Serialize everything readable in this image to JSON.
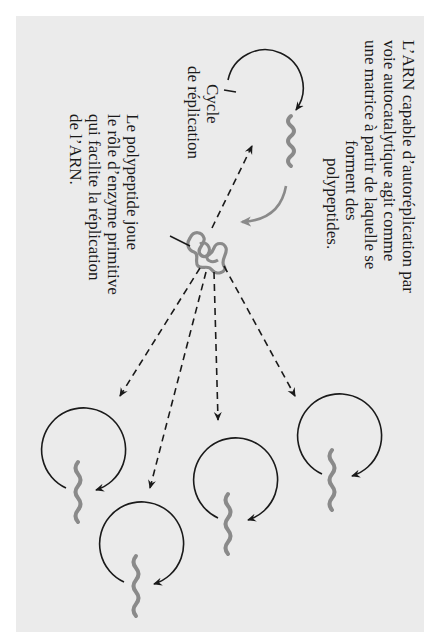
{
  "figure": {
    "orientation": "rotated 90 degrees clockwise",
    "background_color": "#ebebeb",
    "rna_color": "#888888",
    "arrow_color": "#1a1a1a",
    "labels": {
      "main_caption": {
        "lines": [
          "L’ARN capable d’autoréplication par",
          "voie autocatalytique agit comme",
          "une matrice à partir de laquelle se",
          "forment des",
          "polypeptides."
        ]
      },
      "cycle_label": {
        "lines": [
          "Cycle",
          "de réplication"
        ]
      },
      "polypeptide_label": {
        "lines": [
          "Le polypeptide joue",
          "le rôle d’enzyme primitive",
          "qui facilite la réplication",
          "de l’ARN."
        ]
      }
    },
    "elements": {
      "replication_cycles": 5,
      "polypeptide_knots": 1,
      "dashed_arrows": 5
    }
  }
}
